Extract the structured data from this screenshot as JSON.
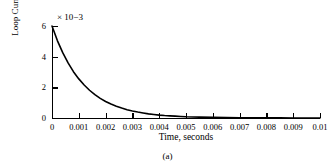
{
  "figure": {
    "caption": "(a)",
    "background_color": "#ffffff",
    "line_color": "#000000"
  },
  "chart_data": {
    "type": "line",
    "title": "",
    "subtitle": "",
    "xlabel": "Time, seconds",
    "ylabel": "Loop Current, amperes",
    "y_multiplier_prefix": "× 10",
    "y_multiplier_exponent": "−3",
    "y_multiplier_text": "× 10−3",
    "xlim": [
      0,
      0.01
    ],
    "ylim": [
      0,
      6
    ],
    "grid": false,
    "legend": null,
    "legend_position": "none",
    "xticks": [
      0,
      0.001,
      0.002,
      0.003,
      0.004,
      0.005,
      0.006,
      0.007,
      0.008,
      0.009,
      0.01
    ],
    "xticklabels": [
      "0",
      "0.001",
      "0.002",
      "0.003",
      "0.004",
      "0.005",
      "0.006",
      "0.007",
      "0.008",
      "0.009",
      "0.01"
    ],
    "yticks": [
      0,
      2,
      4,
      6
    ],
    "yticklabels": [
      "0",
      "2",
      "4",
      "6"
    ],
    "series": [
      {
        "name": "Loop Current",
        "color": "#000000",
        "x": [
          0,
          0.0002,
          0.0004,
          0.0006,
          0.0008,
          0.001,
          0.0012,
          0.0014,
          0.0016,
          0.0018,
          0.002,
          0.0022,
          0.0024,
          0.0026,
          0.0028,
          0.003,
          0.0032,
          0.0034,
          0.0036,
          0.0038,
          0.004,
          0.0042,
          0.0044,
          0.0046,
          0.0048,
          0.005,
          0.0055,
          0.006,
          0.0065,
          0.007,
          0.0075,
          0.008,
          0.0085,
          0.009,
          0.0095,
          0.01
        ],
        "y": [
          6.0,
          5.05,
          4.26,
          3.59,
          3.02,
          2.55,
          2.15,
          1.81,
          1.52,
          1.28,
          1.08,
          0.91,
          0.77,
          0.65,
          0.54,
          0.46,
          0.39,
          0.33,
          0.27,
          0.23,
          0.19,
          0.16,
          0.14,
          0.12,
          0.1,
          0.08,
          0.06,
          0.04,
          0.03,
          0.02,
          0.01,
          0.01,
          0.01,
          0.0,
          0.0,
          0.0
        ],
        "y_units": "1e-3 amperes",
        "model": "I(t) = 6e-3 * exp(-t / 0.00117)"
      }
    ]
  }
}
